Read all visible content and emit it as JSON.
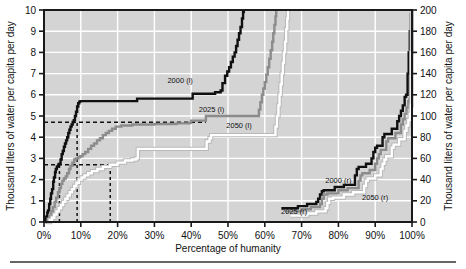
{
  "chart_data": {
    "type": "line",
    "title": "",
    "xlabel": "Percentage of humanity",
    "ylabel_left": "Thousand liters of water per capita per day",
    "ylabel_right": "Thousand liters of water per capita per day",
    "xlim": [
      0,
      100
    ],
    "ylim_left": [
      0,
      10
    ],
    "ylim_right": [
      0,
      200
    ],
    "grid": true,
    "legend_position": "inline-labels",
    "xticks": [
      "0%",
      "10%",
      "20%",
      "30%",
      "40%",
      "50%",
      "60%",
      "70%",
      "80%",
      "90%",
      "100%"
    ],
    "xtick_values": [
      0,
      10,
      20,
      30,
      40,
      50,
      60,
      70,
      80,
      90,
      100
    ],
    "yticks_left": [
      "0",
      "1",
      "2",
      "3",
      "4",
      "5",
      "6",
      "7",
      "8",
      "9",
      "10"
    ],
    "ytick_values_left": [
      0,
      1,
      2,
      3,
      4,
      5,
      6,
      7,
      8,
      9,
      10
    ],
    "yticks_right": [
      "0",
      "20",
      "40",
      "60",
      "80",
      "100",
      "120",
      "140",
      "160",
      "180",
      "200"
    ],
    "ytick_values_right": [
      0,
      20,
      40,
      60,
      80,
      100,
      120,
      140,
      160,
      180,
      200
    ],
    "colors": {
      "series_2000": "#101010",
      "series_2025": "#8c8c8c",
      "series_2050": "#ffffff",
      "plot_background": "#d4d4d4",
      "gridline": "#ffffff",
      "axis": "#1a1a1a",
      "reference_line": "#111111"
    },
    "series": [
      {
        "name": "2000 (l)",
        "axis": "left",
        "color": "#101010",
        "label_x": 37,
        "label_y": 6.55,
        "points": [
          [
            0.3,
            0
          ],
          [
            0.6,
            0.25
          ],
          [
            0.9,
            0.45
          ],
          [
            1.1,
            0.55
          ],
          [
            1.4,
            0.85
          ],
          [
            1.7,
            1.1
          ],
          [
            1.9,
            1.35
          ],
          [
            2.2,
            1.55
          ],
          [
            2.5,
            1.9
          ],
          [
            2.7,
            2.1
          ],
          [
            3.0,
            2.35
          ],
          [
            3.2,
            2.5
          ],
          [
            3.5,
            2.62
          ],
          [
            3.9,
            2.72
          ],
          [
            4.2,
            2.75
          ],
          [
            4.5,
            2.95
          ],
          [
            4.8,
            3.2
          ],
          [
            5.1,
            3.35
          ],
          [
            5.4,
            3.55
          ],
          [
            5.7,
            3.7
          ],
          [
            6.0,
            3.85
          ],
          [
            6.3,
            4.0
          ],
          [
            6.6,
            4.2
          ],
          [
            6.9,
            4.35
          ],
          [
            7.2,
            4.5
          ],
          [
            7.5,
            4.6
          ],
          [
            7.8,
            4.72
          ],
          [
            8.1,
            4.8
          ],
          [
            8.4,
            5.0
          ],
          [
            8.7,
            5.2
          ],
          [
            9.0,
            5.45
          ],
          [
            9.3,
            5.6
          ],
          [
            9.6,
            5.68
          ],
          [
            9.9,
            5.7
          ],
          [
            25.0,
            5.7
          ],
          [
            25.3,
            5.82
          ],
          [
            40.0,
            5.82
          ],
          [
            40.4,
            6.05
          ],
          [
            46.0,
            6.05
          ],
          [
            46.5,
            6.12
          ],
          [
            48.0,
            6.2
          ],
          [
            48.5,
            6.55
          ],
          [
            49.2,
            6.9
          ],
          [
            49.8,
            7.1
          ],
          [
            50.3,
            7.3
          ],
          [
            50.8,
            7.55
          ],
          [
            51.3,
            7.8
          ],
          [
            51.8,
            8.0
          ],
          [
            52.2,
            8.3
          ],
          [
            52.6,
            8.6
          ],
          [
            53.0,
            8.9
          ],
          [
            53.4,
            9.2
          ],
          [
            53.8,
            9.6
          ],
          [
            54.1,
            9.9
          ],
          [
            54.3,
            10.0
          ]
        ]
      },
      {
        "name": "2025 (l)",
        "axis": "left",
        "color": "#8c8c8c",
        "label_x": 45.5,
        "label_y": 5.2,
        "points": [
          [
            0.6,
            0
          ],
          [
            1.0,
            0.15
          ],
          [
            1.5,
            0.3
          ],
          [
            2.0,
            0.5
          ],
          [
            2.4,
            0.7
          ],
          [
            2.9,
            0.95
          ],
          [
            3.3,
            1.15
          ],
          [
            3.8,
            1.4
          ],
          [
            4.2,
            1.6
          ],
          [
            4.6,
            1.8
          ],
          [
            5.0,
            1.95
          ],
          [
            5.4,
            2.05
          ],
          [
            5.9,
            2.15
          ],
          [
            6.3,
            2.3
          ],
          [
            6.8,
            2.5
          ],
          [
            7.2,
            2.65
          ],
          [
            7.7,
            2.8
          ],
          [
            8.2,
            2.95
          ],
          [
            8.7,
            3.0
          ],
          [
            9.3,
            3.05
          ],
          [
            9.8,
            3.1
          ],
          [
            10.5,
            3.2
          ],
          [
            11.2,
            3.3
          ],
          [
            12.0,
            3.45
          ],
          [
            12.8,
            3.6
          ],
          [
            13.6,
            3.7
          ],
          [
            14.4,
            3.85
          ],
          [
            15.2,
            3.95
          ],
          [
            16.0,
            4.1
          ],
          [
            16.8,
            4.2
          ],
          [
            17.6,
            4.3
          ],
          [
            18.5,
            4.4
          ],
          [
            19.5,
            4.5
          ],
          [
            21.0,
            4.55
          ],
          [
            24.0,
            4.6
          ],
          [
            30.0,
            4.62
          ],
          [
            36.0,
            4.65
          ],
          [
            39.5,
            4.68
          ],
          [
            40.0,
            4.78
          ],
          [
            43.5,
            4.78
          ],
          [
            44.0,
            5.0
          ],
          [
            58.0,
            5.0
          ],
          [
            58.4,
            5.3
          ],
          [
            58.8,
            5.65
          ],
          [
            59.2,
            6.0
          ],
          [
            59.6,
            6.3
          ],
          [
            60.0,
            6.6
          ],
          [
            60.4,
            6.95
          ],
          [
            60.8,
            7.3
          ],
          [
            61.2,
            7.7
          ],
          [
            61.6,
            8.1
          ],
          [
            62.0,
            8.5
          ],
          [
            62.3,
            8.9
          ],
          [
            62.6,
            9.3
          ],
          [
            62.9,
            9.7
          ],
          [
            63.1,
            10.0
          ]
        ]
      },
      {
        "name": "2050 (l)",
        "axis": "left",
        "color": "#ffffff",
        "label_x": 53,
        "label_y": 4.45,
        "points": [
          [
            1.0,
            0
          ],
          [
            1.6,
            0.1
          ],
          [
            2.2,
            0.2
          ],
          [
            2.8,
            0.35
          ],
          [
            3.4,
            0.5
          ],
          [
            4.0,
            0.65
          ],
          [
            4.6,
            0.8
          ],
          [
            5.2,
            0.95
          ],
          [
            5.8,
            1.1
          ],
          [
            6.4,
            1.25
          ],
          [
            7.0,
            1.4
          ],
          [
            7.6,
            1.55
          ],
          [
            8.2,
            1.7
          ],
          [
            8.8,
            1.85
          ],
          [
            9.5,
            2.0
          ],
          [
            10.2,
            2.1
          ],
          [
            11.0,
            2.2
          ],
          [
            12.0,
            2.3
          ],
          [
            13.0,
            2.4
          ],
          [
            14.5,
            2.5
          ],
          [
            16.0,
            2.6
          ],
          [
            18.0,
            2.7
          ],
          [
            20.0,
            2.8
          ],
          [
            22.0,
            2.9
          ],
          [
            24.0,
            2.95
          ],
          [
            25.0,
            3.0
          ],
          [
            25.5,
            3.45
          ],
          [
            43.8,
            3.45
          ],
          [
            44.2,
            3.8
          ],
          [
            45.0,
            3.95
          ],
          [
            45.4,
            4.1
          ],
          [
            62.5,
            4.1
          ],
          [
            62.9,
            4.5
          ],
          [
            63.3,
            5.0
          ],
          [
            63.7,
            5.5
          ],
          [
            64.0,
            6.0
          ],
          [
            64.3,
            6.5
          ],
          [
            64.6,
            7.0
          ],
          [
            64.9,
            7.5
          ],
          [
            65.2,
            8.0
          ],
          [
            65.5,
            8.5
          ],
          [
            65.8,
            9.1
          ],
          [
            66.1,
            9.6
          ],
          [
            66.3,
            10.0
          ]
        ]
      },
      {
        "name": "2000 (r)",
        "axis": "right",
        "color": "#101010",
        "label_x": 80,
        "label_y": 37,
        "points": [
          [
            64.5,
            13
          ],
          [
            68.5,
            13
          ],
          [
            69.0,
            15
          ],
          [
            71.0,
            15
          ],
          [
            71.5,
            17
          ],
          [
            73.5,
            17
          ],
          [
            74.0,
            19
          ],
          [
            74.5,
            22
          ],
          [
            75.0,
            26
          ],
          [
            75.5,
            29
          ],
          [
            76.0,
            30
          ],
          [
            78.5,
            30
          ],
          [
            79.0,
            33
          ],
          [
            81.0,
            33
          ],
          [
            81.5,
            35
          ],
          [
            84.0,
            35
          ],
          [
            84.5,
            44
          ],
          [
            85.0,
            50
          ],
          [
            85.5,
            52
          ],
          [
            87.0,
            52
          ],
          [
            87.5,
            55
          ],
          [
            88.5,
            55
          ],
          [
            89.0,
            60
          ],
          [
            89.5,
            66
          ],
          [
            90.0,
            70
          ],
          [
            90.5,
            72
          ],
          [
            91.5,
            72
          ],
          [
            92.0,
            80
          ],
          [
            92.5,
            83
          ],
          [
            94.0,
            83
          ],
          [
            94.5,
            88
          ],
          [
            95.5,
            88
          ],
          [
            96.0,
            95
          ],
          [
            96.5,
            100
          ],
          [
            97.0,
            105
          ],
          [
            97.5,
            110
          ],
          [
            98.0,
            118
          ],
          [
            98.4,
            120
          ],
          [
            98.8,
            140
          ],
          [
            99.1,
            160
          ],
          [
            99.4,
            180
          ],
          [
            99.7,
            196
          ],
          [
            99.9,
            200
          ]
        ]
      },
      {
        "name": "2025 (r)",
        "axis": "right",
        "color": "#8c8c8c",
        "label_x": 68,
        "label_y": 8,
        "points": [
          [
            65.5,
            10
          ],
          [
            69.5,
            10
          ],
          [
            70.0,
            12
          ],
          [
            72.0,
            12
          ],
          [
            72.5,
            14
          ],
          [
            74.5,
            14
          ],
          [
            75.0,
            17
          ],
          [
            75.5,
            22
          ],
          [
            76.0,
            26
          ],
          [
            77.0,
            27
          ],
          [
            79.5,
            27
          ],
          [
            80.0,
            30
          ],
          [
            82.0,
            30
          ],
          [
            82.5,
            32
          ],
          [
            85.0,
            32
          ],
          [
            85.5,
            39
          ],
          [
            86.0,
            44
          ],
          [
            86.5,
            46
          ],
          [
            88.0,
            46
          ],
          [
            88.5,
            49
          ],
          [
            89.5,
            49
          ],
          [
            90.0,
            55
          ],
          [
            90.5,
            60
          ],
          [
            91.0,
            64
          ],
          [
            91.5,
            68
          ],
          [
            92.5,
            68
          ],
          [
            93.0,
            76
          ],
          [
            93.5,
            79
          ],
          [
            95.0,
            79
          ],
          [
            95.5,
            84
          ],
          [
            96.5,
            84
          ],
          [
            97.0,
            92
          ],
          [
            97.5,
            97
          ],
          [
            98.0,
            102
          ],
          [
            98.5,
            108
          ],
          [
            99.0,
            114
          ],
          [
            99.3,
            116
          ],
          [
            99.6,
            160
          ],
          [
            99.8,
            190
          ],
          [
            99.95,
            200
          ]
        ]
      },
      {
        "name": "2050 (r)",
        "axis": "right",
        "color": "#ffffff",
        "label_x": 90,
        "label_y": 21,
        "points": [
          [
            67.0,
            6
          ],
          [
            71.0,
            6
          ],
          [
            71.5,
            8
          ],
          [
            73.5,
            8
          ],
          [
            74.0,
            10
          ],
          [
            76.0,
            10
          ],
          [
            76.5,
            13
          ],
          [
            77.0,
            18
          ],
          [
            77.5,
            22
          ],
          [
            78.5,
            23
          ],
          [
            81.0,
            23
          ],
          [
            81.5,
            26
          ],
          [
            83.5,
            26
          ],
          [
            84.0,
            28
          ],
          [
            86.5,
            28
          ],
          [
            87.0,
            34
          ],
          [
            87.5,
            39
          ],
          [
            88.0,
            41
          ],
          [
            89.5,
            41
          ],
          [
            90.0,
            44
          ],
          [
            91.0,
            44
          ],
          [
            91.5,
            50
          ],
          [
            92.0,
            55
          ],
          [
            92.5,
            59
          ],
          [
            93.0,
            62
          ],
          [
            94.0,
            62
          ],
          [
            94.5,
            70
          ],
          [
            95.0,
            73
          ],
          [
            96.0,
            73
          ],
          [
            96.5,
            78
          ],
          [
            97.5,
            78
          ],
          [
            98.0,
            86
          ],
          [
            98.5,
            91
          ],
          [
            99.0,
            96
          ],
          [
            99.4,
            102
          ],
          [
            99.7,
            110
          ],
          [
            99.85,
            160
          ],
          [
            99.95,
            200
          ]
        ]
      }
    ],
    "reference_lines": [
      {
        "name": "upper-horizontal",
        "orientation": "horizontal",
        "axis": "left",
        "value": 4.7,
        "x_from": 0,
        "x_to": 44
      },
      {
        "name": "lower-horizontal",
        "orientation": "horizontal",
        "axis": "left",
        "value": 2.7,
        "x_from": 0,
        "x_to": 18
      },
      {
        "name": "drop-a",
        "orientation": "vertical",
        "x": 4.2,
        "y_from": 0,
        "y_to": 2.7
      },
      {
        "name": "drop-b",
        "orientation": "vertical",
        "x": 9.0,
        "y_from": 0,
        "y_to": 4.7
      },
      {
        "name": "drop-c",
        "orientation": "vertical",
        "x": 18.0,
        "y_from": 0,
        "y_to": 2.7
      }
    ]
  }
}
